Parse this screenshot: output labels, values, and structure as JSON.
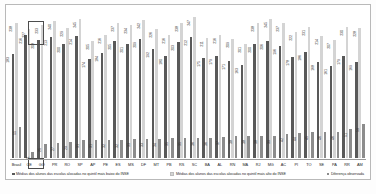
{
  "chart_data": {
    "type": "bar",
    "title": "",
    "xlabel": "",
    "ylabel": "",
    "ylim": [
      0,
      260
    ],
    "grid": false,
    "legend_position": "bottom",
    "categories": [
      "Brasil",
      "CE",
      "GO",
      "PR",
      "RO",
      "SP",
      "AP",
      "PE",
      "ES",
      "MS",
      "DF",
      "MT",
      "PB",
      "RS",
      "SC",
      "BA",
      "AL",
      "RN",
      "MA",
      "RJ",
      "MG",
      "AC",
      "PI",
      "TO",
      "SE",
      "PA",
      "RR",
      "AM"
    ],
    "series": [
      {
        "name": "Médias dos alunos das escolas alocadas no quintil mais baixo do INSE",
        "color": "#595959",
        "values": [
          183,
          216,
          208,
          213,
          200,
          214,
          174,
          184,
          205,
          201,
          209,
          192,
          180,
          203,
          212,
          175,
          179,
          171,
          163,
          200,
          206,
          196,
          178,
          186,
          168,
          161,
          179,
          169
        ]
      },
      {
        "name": "Médias dos alunos das escolas alocadas no quintil mais alto do INSE",
        "color": "#d4d4d4",
        "values": [
          238,
          227,
          233,
          240,
          229,
          245,
          205,
          216,
          237,
          234,
          242,
          226,
          216,
          238,
          247,
          211,
          216,
          209,
          201,
          238,
          245,
          237,
          222,
          231,
          214,
          207,
          230,
          228
        ]
      },
      {
        "name": "Diferença observada",
        "color": "#8c8c8c",
        "values": [
          55,
          11,
          25,
          27,
          29,
          31,
          31,
          32,
          32,
          33,
          33,
          34,
          35,
          35,
          36,
          36,
          37,
          38,
          38,
          38,
          39,
          42,
          44,
          45,
          46,
          46,
          51,
          59
        ]
      }
    ],
    "highlight_category": "CE"
  },
  "legend": [
    {
      "label": "Médias dos alunos das escolas alocadas no quintil mais baixo do INSE"
    },
    {
      "label": "Médias dos alunos das escolas alocadas no quintil mais alto do INSE"
    },
    {
      "label": "Diferença observada"
    }
  ],
  "footnote": ""
}
